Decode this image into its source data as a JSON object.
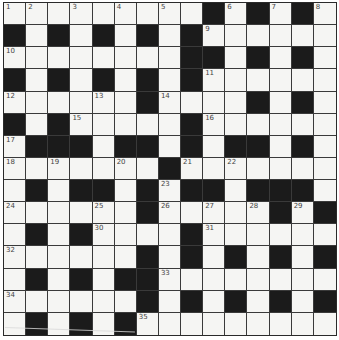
{
  "puzzle": {
    "rows": 15,
    "cols": 15,
    "colors": {
      "white_cell": "#f5f5f3",
      "black_cell": "#1b1b1b",
      "grid_line": "#3a3a3a",
      "number_text": "#444444"
    },
    "layout": [
      "WWWWWWWWWBWBWBW",
      "BWBWBWBWBWWWWWW",
      "WWWWWWWWBBWBWBW",
      "BWBWBWBWBWWWWWW",
      "WWWWWWBWWWWBWBW",
      "BWBWWWWWBWWWWWW",
      "WBBBWBBWBWBBWBW",
      "WWWWWWWBWWWWWWW",
      "WBWBBWBWBBWBBBW",
      "WWWWWWBWWWWWBWB",
      "WBWBWWWWBWWWWWW",
      "WWWWWWBWBWBWBWB",
      "WBWBWBBWWWWWWWW",
      "WWWWWWBWBWBWBWB",
      "WBWBWBWWWWWWWWW"
    ],
    "numbers": [
      {
        "row": 0,
        "col": 0,
        "n": "1"
      },
      {
        "row": 0,
        "col": 1,
        "n": "2"
      },
      {
        "row": 0,
        "col": 3,
        "n": "3"
      },
      {
        "row": 0,
        "col": 5,
        "n": "4"
      },
      {
        "row": 0,
        "col": 7,
        "n": "5"
      },
      {
        "row": 0,
        "col": 10,
        "n": "6"
      },
      {
        "row": 0,
        "col": 12,
        "n": "7"
      },
      {
        "row": 0,
        "col": 14,
        "n": "8"
      },
      {
        "row": 1,
        "col": 9,
        "n": "9"
      },
      {
        "row": 2,
        "col": 0,
        "n": "10"
      },
      {
        "row": 3,
        "col": 9,
        "n": "11"
      },
      {
        "row": 4,
        "col": 0,
        "n": "12"
      },
      {
        "row": 4,
        "col": 4,
        "n": "13"
      },
      {
        "row": 4,
        "col": 7,
        "n": "14"
      },
      {
        "row": 5,
        "col": 3,
        "n": "15"
      },
      {
        "row": 5,
        "col": 9,
        "n": "16"
      },
      {
        "row": 6,
        "col": 0,
        "n": "17"
      },
      {
        "row": 7,
        "col": 0,
        "n": "18"
      },
      {
        "row": 7,
        "col": 2,
        "n": "19"
      },
      {
        "row": 7,
        "col": 5,
        "n": "20"
      },
      {
        "row": 7,
        "col": 8,
        "n": "21"
      },
      {
        "row": 7,
        "col": 10,
        "n": "22"
      },
      {
        "row": 8,
        "col": 7,
        "n": "23"
      },
      {
        "row": 9,
        "col": 0,
        "n": "24"
      },
      {
        "row": 9,
        "col": 4,
        "n": "25"
      },
      {
        "row": 9,
        "col": 7,
        "n": "26"
      },
      {
        "row": 9,
        "col": 9,
        "n": "27"
      },
      {
        "row": 9,
        "col": 11,
        "n": "28"
      },
      {
        "row": 9,
        "col": 13,
        "n": "29"
      },
      {
        "row": 10,
        "col": 4,
        "n": "30"
      },
      {
        "row": 10,
        "col": 9,
        "n": "31"
      },
      {
        "row": 11,
        "col": 0,
        "n": "32"
      },
      {
        "row": 12,
        "col": 7,
        "n": "33"
      },
      {
        "row": 13,
        "col": 0,
        "n": "34"
      },
      {
        "row": 14,
        "col": 6,
        "n": "35"
      }
    ]
  }
}
